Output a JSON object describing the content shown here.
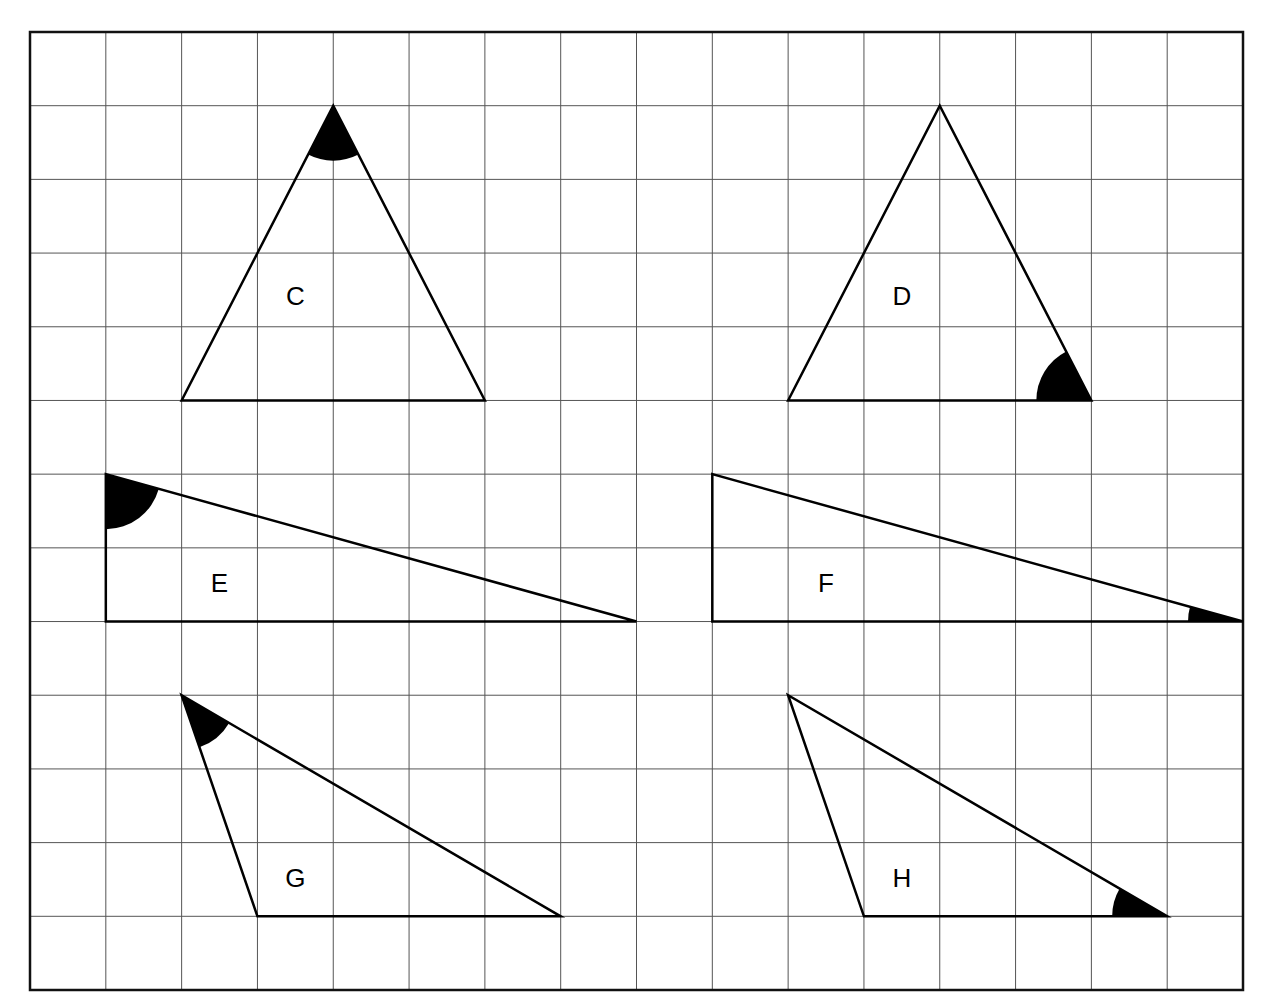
{
  "figure": {
    "grid": {
      "cols": 16,
      "rows": 13,
      "x0": 30,
      "y0": 32,
      "x1": 1243,
      "y1": 990
    },
    "triangles": [
      {
        "label": "C",
        "vertices": [
          [
            2,
            5
          ],
          [
            6,
            5
          ],
          [
            4,
            1
          ]
        ],
        "marked_vertex": 2,
        "label_pos": [
          3.5,
          3.7
        ]
      },
      {
        "label": "D",
        "vertices": [
          [
            10,
            5
          ],
          [
            14,
            5
          ],
          [
            12,
            1
          ]
        ],
        "marked_vertex": 1,
        "label_pos": [
          11.5,
          3.7
        ]
      },
      {
        "label": "E",
        "vertices": [
          [
            1,
            6
          ],
          [
            1,
            8
          ],
          [
            8,
            8
          ]
        ],
        "marked_vertex": 0,
        "label_pos": [
          2.5,
          7.6
        ]
      },
      {
        "label": "F",
        "vertices": [
          [
            9,
            6
          ],
          [
            9,
            8
          ],
          [
            16,
            8
          ]
        ],
        "marked_vertex": 2,
        "label_pos": [
          10.5,
          7.6
        ]
      },
      {
        "label": "G",
        "vertices": [
          [
            2,
            9
          ],
          [
            3,
            12
          ],
          [
            7,
            12
          ]
        ],
        "marked_vertex": 0,
        "label_pos": [
          3.5,
          11.6
        ]
      },
      {
        "label": "H",
        "vertices": [
          [
            10,
            9
          ],
          [
            11,
            12
          ],
          [
            15,
            12
          ]
        ],
        "marked_vertex": 2,
        "label_pos": [
          11.5,
          11.6
        ]
      }
    ],
    "colors": {
      "line": "#000000",
      "grid": "#555555",
      "background": "#ffffff"
    }
  }
}
